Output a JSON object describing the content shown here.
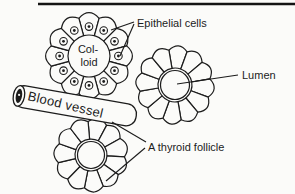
{
  "figure": {
    "labels": {
      "epithelial_cells": "Epithelial cells",
      "colloid_line1": "Col-",
      "colloid_line2": "loid",
      "lumen": "Lumen",
      "blood_vessel": "Blood vessel",
      "thyroid_follicle": "A thyroid follicle"
    },
    "colors": {
      "ink": "#1c1c1c",
      "paper": "#fbfbf9",
      "vessel_core": "#1c1c1c"
    }
  }
}
